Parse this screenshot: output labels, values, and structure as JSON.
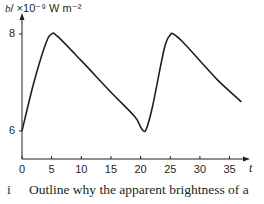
{
  "chart_data": {
    "type": "line",
    "title": "",
    "ylabel_var": "b",
    "ylabel_unit": "/ ×10⁻⁹ W m⁻²",
    "xlabel": "t",
    "x_ticks": [
      "0",
      "5",
      "10",
      "15",
      "20",
      "25",
      "30",
      "35"
    ],
    "y_ticks": [
      "6",
      "8"
    ],
    "xlim": [
      0,
      37
    ],
    "ylim": [
      5,
      8.3
    ],
    "grid": false,
    "series": [
      {
        "name": "apparent brightness",
        "x": [
          0,
          2,
          4,
          5,
          6,
          10,
          15,
          19,
          20,
          20.5,
          21,
          22,
          24,
          25,
          25.5,
          27,
          30,
          33,
          37
        ],
        "y": [
          6.0,
          7.0,
          7.8,
          8.0,
          7.95,
          7.45,
          6.8,
          6.3,
          6.08,
          6.0,
          6.05,
          6.5,
          7.7,
          7.98,
          8.0,
          7.85,
          7.45,
          7.05,
          6.6
        ]
      }
    ],
    "color": "#231f20"
  },
  "question": {
    "number": "i",
    "text": "Outline why the apparent brightness of a"
  }
}
